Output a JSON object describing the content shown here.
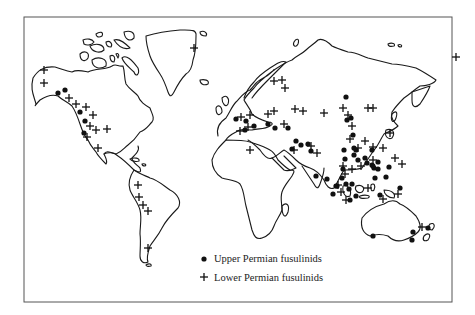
{
  "figure": {
    "frame": {
      "x": 24,
      "y": 17,
      "width": 428,
      "height": 285
    }
  },
  "legend": {
    "items": [
      {
        "symbol": "dot",
        "icon": "filled-circle-icon",
        "label": "Upper Permian fusulinids"
      },
      {
        "symbol": "cross",
        "icon": "plus-icon",
        "label": "Lower Permian fusulinids"
      }
    ]
  },
  "colors": {
    "ink": "#111111",
    "background": "#ffffff",
    "frame": "#555555"
  },
  "markers": {
    "upper_permian_dots": [
      [
        58,
        93
      ],
      [
        65,
        90
      ],
      [
        80,
        112
      ],
      [
        85,
        121
      ],
      [
        84,
        133
      ],
      [
        236,
        119
      ],
      [
        246,
        121
      ],
      [
        245,
        130
      ],
      [
        254,
        126
      ],
      [
        268,
        124
      ],
      [
        275,
        128
      ],
      [
        288,
        128
      ],
      [
        296,
        141
      ],
      [
        308,
        144
      ],
      [
        311,
        151
      ],
      [
        301,
        145
      ],
      [
        292,
        149
      ],
      [
        316,
        176
      ],
      [
        346,
        97
      ],
      [
        347,
        120
      ],
      [
        351,
        118
      ],
      [
        353,
        135
      ],
      [
        354,
        148
      ],
      [
        356,
        150
      ],
      [
        344,
        150
      ],
      [
        345,
        159
      ],
      [
        354,
        155
      ],
      [
        358,
        160
      ],
      [
        365,
        158
      ],
      [
        372,
        150
      ],
      [
        372,
        165
      ],
      [
        378,
        162
      ],
      [
        389,
        167
      ],
      [
        374,
        168
      ],
      [
        367,
        163
      ],
      [
        343,
        169
      ],
      [
        342,
        178
      ],
      [
        346,
        184
      ],
      [
        352,
        184
      ],
      [
        349,
        189
      ],
      [
        373,
        166
      ],
      [
        378,
        169
      ],
      [
        375,
        178
      ],
      [
        386,
        177
      ],
      [
        400,
        188
      ],
      [
        380,
        195
      ],
      [
        327,
        179
      ],
      [
        337,
        186
      ],
      [
        333,
        194
      ],
      [
        350,
        200
      ],
      [
        356,
        196
      ],
      [
        336,
        186
      ],
      [
        373,
        236
      ],
      [
        413,
        232
      ],
      [
        428,
        228
      ],
      [
        412,
        240
      ]
    ],
    "lower_permian_crosses": [
      [
        44,
        70
      ],
      [
        44,
        83
      ],
      [
        69,
        98
      ],
      [
        76,
        104
      ],
      [
        86,
        107
      ],
      [
        93,
        115
      ],
      [
        90,
        126
      ],
      [
        87,
        137
      ],
      [
        96,
        130
      ],
      [
        107,
        129
      ],
      [
        98,
        148
      ],
      [
        194,
        48
      ],
      [
        274,
        81
      ],
      [
        282,
        80
      ],
      [
        285,
        88
      ],
      [
        274,
        111
      ],
      [
        295,
        109
      ],
      [
        241,
        117
      ],
      [
        250,
        115
      ],
      [
        248,
        127
      ],
      [
        240,
        131
      ],
      [
        268,
        114
      ],
      [
        284,
        124
      ],
      [
        303,
        111
      ],
      [
        324,
        113
      ],
      [
        348,
        115
      ],
      [
        368,
        108
      ],
      [
        250,
        150
      ],
      [
        294,
        150
      ],
      [
        311,
        146
      ],
      [
        317,
        153
      ],
      [
        343,
        108
      ],
      [
        373,
        108
      ],
      [
        352,
        126
      ],
      [
        350,
        139
      ],
      [
        365,
        141
      ],
      [
        373,
        147
      ],
      [
        390,
        133
      ],
      [
        395,
        158
      ],
      [
        402,
        164
      ],
      [
        373,
        160
      ],
      [
        358,
        148
      ],
      [
        343,
        166
      ],
      [
        352,
        169
      ],
      [
        361,
        166
      ],
      [
        345,
        174
      ],
      [
        338,
        185
      ],
      [
        341,
        192
      ],
      [
        346,
        200
      ],
      [
        383,
        199
      ],
      [
        368,
        188
      ],
      [
        398,
        194
      ],
      [
        422,
        227
      ],
      [
        456,
        57
      ],
      [
        383,
        148
      ],
      [
        138,
        185
      ],
      [
        139,
        197
      ],
      [
        143,
        205
      ],
      [
        148,
        211
      ],
      [
        148,
        248
      ]
    ]
  }
}
